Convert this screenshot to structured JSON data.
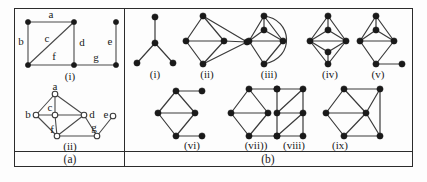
{
  "figure": {
    "panels": [
      {
        "id": "a",
        "caption": "(a)",
        "subfigures": [
          {
            "id": "a-i",
            "caption": "(i)",
            "node_style": "filled",
            "edge_labels": [
              "a",
              "b",
              "c",
              "d",
              "e",
              "f",
              "g"
            ]
          },
          {
            "id": "a-ii",
            "caption": "(ii)",
            "node_style": "open",
            "vertex_labels": [
              "a",
              "b",
              "c",
              "d",
              "e",
              "f",
              "g"
            ]
          }
        ]
      },
      {
        "id": "b",
        "caption": "(b)",
        "subfigures": [
          {
            "id": "b-i",
            "caption": "(i)"
          },
          {
            "id": "b-ii",
            "caption": "(ii)"
          },
          {
            "id": "b-iii",
            "caption": "(iii)"
          },
          {
            "id": "b-iv",
            "caption": "(iv)"
          },
          {
            "id": "b-v",
            "caption": "(v)"
          },
          {
            "id": "b-vi",
            "caption": "(vi)"
          },
          {
            "id": "b-vii",
            "caption": "(vii))"
          },
          {
            "id": "b-viii",
            "caption": "(viii)"
          },
          {
            "id": "b-ix",
            "caption": "(ix)"
          }
        ]
      }
    ]
  },
  "labels": {
    "a_edge_a": "a",
    "a_edge_b": "b",
    "a_edge_c": "c",
    "a_edge_d": "d",
    "a_edge_e": "e",
    "a_edge_f": "f",
    "a_edge_g": "g",
    "a_cap_i": "(i)",
    "a_vert_a": "a",
    "a_vert_b": "b",
    "a_vert_c": "c",
    "a_vert_d": "d",
    "a_vert_e": "e",
    "a_vert_f": "f",
    "a_vert_g": "g",
    "a_cap_ii": "(ii)",
    "panel_a": "(a)",
    "panel_b": "(b)",
    "b_cap_i": "(i)",
    "b_cap_ii": "(ii)",
    "b_cap_iii": "(iii)",
    "b_cap_iv": "(iv)",
    "b_cap_v": "(v)",
    "b_cap_vi": "(vi)",
    "b_cap_vii": "(vii))",
    "b_cap_viii": "(viii)",
    "b_cap_ix": "(ix)"
  },
  "colors": {
    "frame": "#2b2b2b",
    "edge": "#4a4a4a",
    "node_fill": "#1a1a1a",
    "node_open": "#ffffff",
    "background": "#fdfdfd"
  }
}
